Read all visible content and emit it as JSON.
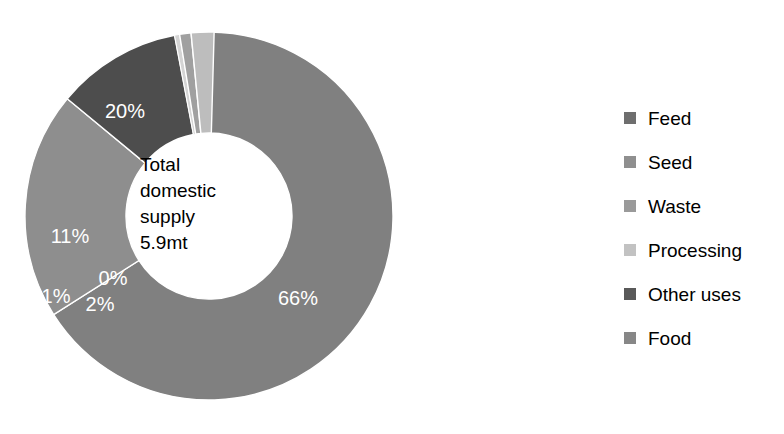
{
  "chart_data": {
    "type": "pie",
    "variant": "donut",
    "title": "",
    "center_label_lines": [
      "Total",
      "domestic",
      "supply",
      "5.9mt"
    ],
    "total": "5.9mt",
    "units": "mt",
    "categories": [
      "Food",
      "Feed",
      "Other uses",
      "Processing",
      "Waste",
      "Seed"
    ],
    "values": [
      66,
      20,
      11,
      0,
      1,
      2
    ],
    "value_labels": [
      "66%",
      "20%",
      "11%",
      "0%",
      "1%",
      "2%"
    ],
    "colors": [
      "#808080",
      "#8e8e8e",
      "#4d4d4d",
      "#d4d4d4",
      "#a0a0a0",
      "#bdbdbd"
    ],
    "legend": {
      "position": "right",
      "entries": [
        {
          "label": "Feed",
          "color": "#6e6e6e"
        },
        {
          "label": "Seed",
          "color": "#8f8f8f"
        },
        {
          "label": "Waste",
          "color": "#9a9a9a"
        },
        {
          "label": "Processing",
          "color": "#c2c2c2"
        },
        {
          "label": "Other uses",
          "color": "#595959"
        },
        {
          "label": "Food",
          "color": "#878787"
        }
      ]
    },
    "geometry": {
      "cx": 209,
      "cy": 216,
      "outer_radius": 184,
      "inner_radius": 83,
      "start_angle_deg": 0,
      "direction": "clockwise"
    },
    "slice_labels": [
      {
        "text": "66%",
        "x": 298,
        "y": 300
      },
      {
        "text": "20%",
        "x": 125,
        "y": 113
      },
      {
        "text": "11%",
        "x": 70,
        "y": 238
      },
      {
        "text": "0%",
        "x": 113,
        "y": 280
      },
      {
        "text": "1%",
        "x": 56,
        "y": 298
      },
      {
        "text": "2%",
        "x": 100,
        "y": 306
      }
    ],
    "grid": false,
    "xlabel": "",
    "ylabel": ""
  }
}
